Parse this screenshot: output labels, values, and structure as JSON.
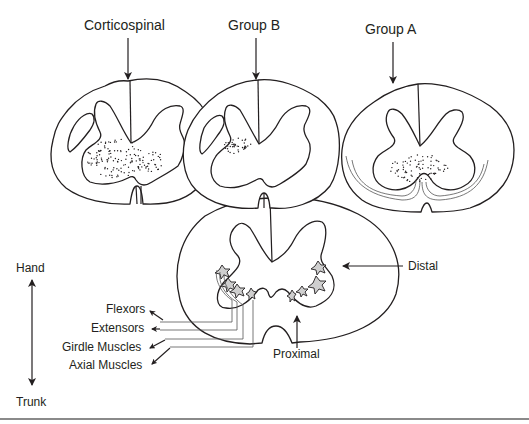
{
  "diagram": {
    "top_labels": {
      "corticospinal": "Corticospinal",
      "group_b": "Group B",
      "group_a": "Group A"
    },
    "bottom_section": {
      "distal": "Distal",
      "proximal": "Proximal"
    },
    "muscle_labels": [
      "Flexors",
      "Extensors",
      "Girdle Muscles",
      "Axial Muscles"
    ],
    "axis": {
      "top": "Hand",
      "bottom": "Trunk"
    },
    "colors": {
      "ink": "#231f20",
      "motor_neuron_fill": "#cfcfcf",
      "rule": "#8a8a8a"
    }
  }
}
